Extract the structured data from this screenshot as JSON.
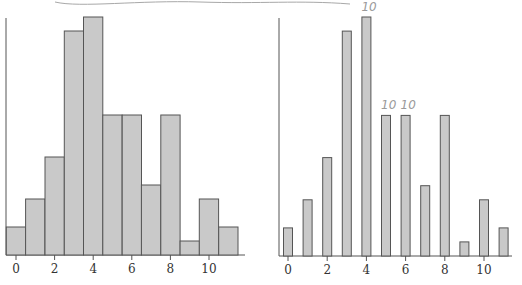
{
  "chart_data": [
    {
      "type": "bar",
      "title": "",
      "xlabel": "",
      "ylabel": "",
      "style": "histogram",
      "categories": [
        0,
        1,
        2,
        3,
        4,
        5,
        6,
        7,
        8,
        9,
        10,
        11
      ],
      "values": [
        2,
        4,
        7,
        16,
        17,
        10,
        10,
        5,
        10,
        1,
        4,
        2
      ],
      "xticks": [
        "0",
        "2",
        "4",
        "6",
        "8",
        "10"
      ],
      "xtick_values": [
        0,
        2,
        4,
        6,
        8,
        10
      ],
      "xlim": [
        -0.5,
        11.5
      ],
      "ylim": [
        0,
        17
      ],
      "grid": false
    },
    {
      "type": "bar",
      "title": "",
      "xlabel": "",
      "ylabel": "",
      "style": "spike",
      "categories": [
        0,
        1,
        2,
        3,
        4,
        5,
        6,
        7,
        8,
        9,
        10,
        11
      ],
      "values": [
        2,
        4,
        7,
        16,
        17,
        10,
        10,
        5,
        10,
        1,
        4,
        2
      ],
      "xticks": [
        "0",
        "2",
        "4",
        "6",
        "8",
        "10"
      ],
      "xtick_values": [
        0,
        2,
        4,
        6,
        8,
        10
      ],
      "xlim": [
        -0.5,
        11.5
      ],
      "ylim": [
        0,
        17
      ],
      "grid": false,
      "annotations": [
        {
          "text": "10",
          "at_category": 4
        },
        {
          "text": "10",
          "at_category": 5
        },
        {
          "text": "10",
          "at_category": 6
        }
      ]
    }
  ],
  "colors": {
    "bar_fill": "#c9c9c9",
    "bar_stroke": "#555555",
    "annotation": "#9a9a9a"
  }
}
